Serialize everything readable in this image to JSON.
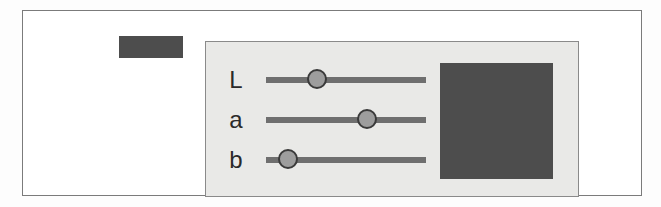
{
  "widget": {
    "name": "lab-color-picker",
    "panel_background": "#e9e9e7",
    "frame_border_color": "#7b7b7b"
  },
  "current_color_swatch": {
    "label": "",
    "color": "#4d4d4d"
  },
  "preview_swatch": {
    "label": "",
    "color": "#4d4d4d"
  },
  "sliders": [
    {
      "id": "L",
      "label": "L",
      "thumb_percent": 32,
      "track_color": "#6f6f6f",
      "thumb_color": "#9d9d9d"
    },
    {
      "id": "a",
      "label": "a",
      "thumb_percent": 63,
      "track_color": "#6f6f6f",
      "thumb_color": "#9d9d9d"
    },
    {
      "id": "b",
      "label": "b",
      "thumb_percent": 14,
      "track_color": "#6f6f6f",
      "thumb_color": "#9d9d9d"
    }
  ]
}
